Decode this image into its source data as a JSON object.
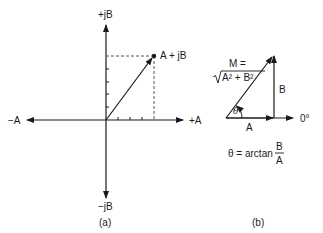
{
  "figure_a": {
    "caption": "(a)",
    "axis_labels": {
      "pos_imag": "+jB",
      "neg_imag": "−jB",
      "pos_real": "+A",
      "neg_real": "−A"
    },
    "point_label": "A + jB",
    "colors": {
      "stroke": "#1a1a1a",
      "dashed": "#555555"
    }
  },
  "figure_b": {
    "caption": "(b)",
    "magnitude_label_line1": "M =",
    "magnitude_label_line2": "A² + B²",
    "side_a_label": "A",
    "side_b_label": "B",
    "reference_label": "0°",
    "angle_symbol": "θ",
    "formula": {
      "lhs": "θ = arctan",
      "numerator": "B",
      "denominator": "A"
    }
  }
}
